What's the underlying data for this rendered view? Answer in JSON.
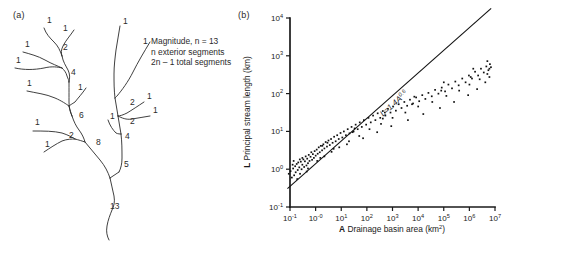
{
  "figure": {
    "panel_a": {
      "label": "(a)",
      "annotation_lines": [
        "Magnitude, n = 13",
        "n exterior segments",
        "2n – 1 total segments"
      ],
      "magnitude_labels": [
        {
          "text": "1",
          "x": 47,
          "y": 23
        },
        {
          "text": "1",
          "x": 63,
          "y": 31
        },
        {
          "text": "1",
          "x": 25,
          "y": 47
        },
        {
          "text": "1",
          "x": 16,
          "y": 63
        },
        {
          "text": "2",
          "x": 63,
          "y": 50
        },
        {
          "text": "1",
          "x": 27,
          "y": 86
        },
        {
          "text": "4",
          "x": 71,
          "y": 75
        },
        {
          "text": "1",
          "x": 78,
          "y": 90
        },
        {
          "text": "6",
          "x": 79,
          "y": 118
        },
        {
          "text": "1",
          "x": 35,
          "y": 125
        },
        {
          "text": "2",
          "x": 69,
          "y": 138
        },
        {
          "text": "1",
          "x": 45,
          "y": 147
        },
        {
          "text": "8",
          "x": 96,
          "y": 145
        },
        {
          "text": "13",
          "x": 110,
          "y": 209
        },
        {
          "text": "1",
          "x": 123,
          "y": 24
        },
        {
          "text": "1",
          "x": 143,
          "y": 44
        },
        {
          "text": "2",
          "x": 130,
          "y": 105
        },
        {
          "text": "1",
          "x": 147,
          "y": 99
        },
        {
          "text": "1",
          "x": 153,
          "y": 113
        },
        {
          "text": "1",
          "x": 110,
          "y": 119
        },
        {
          "text": "2",
          "x": 130,
          "y": 124
        },
        {
          "text": "4",
          "x": 125,
          "y": 139
        },
        {
          "text": "5",
          "x": 124,
          "y": 167
        }
      ]
    },
    "panel_b": {
      "label": "(b)",
      "equation": {
        "base": "L=1.4A",
        "exponent": "0.6"
      },
      "x_axis": {
        "title_symbol": "A",
        "title_text": "Drainage basin area (km",
        "title_sup": "2",
        "title_tail": ")",
        "ticks": [
          {
            "mantissa": "10",
            "exponent": "-1"
          },
          {
            "mantissa": "10",
            "exponent": "-0"
          },
          {
            "mantissa": "10",
            "exponent": "1"
          },
          {
            "mantissa": "10",
            "exponent": "2"
          },
          {
            "mantissa": "10",
            "exponent": "3"
          },
          {
            "mantissa": "10",
            "exponent": "4"
          },
          {
            "mantissa": "10",
            "exponent": "5"
          },
          {
            "mantissa": "10",
            "exponent": "6"
          },
          {
            "mantissa": "10",
            "exponent": "7"
          }
        ]
      },
      "y_axis": {
        "title_symbol": "L",
        "title_text": "Principal stream length (km)",
        "ticks": [
          {
            "mantissa": "10",
            "exponent": "4"
          },
          {
            "mantissa": "10",
            "exponent": "3"
          },
          {
            "mantissa": "10",
            "exponent": "2"
          },
          {
            "mantissa": "10",
            "exponent": "1"
          },
          {
            "mantissa": "10",
            "exponent": "0"
          },
          {
            "mantissa": "10",
            "exponent": "-1"
          }
        ]
      }
    }
  },
  "chart_data": {
    "type": "scatter",
    "title": "",
    "xlabel": "A Drainage basin area (km2)",
    "ylabel": "L Principal stream length (km)",
    "xscale": "log",
    "yscale": "log",
    "xlim": [
      -1,
      7
    ],
    "ylim": [
      -1,
      4
    ],
    "grid": false,
    "legend": null,
    "fit": {
      "label": "L=1.4A^0.6",
      "coefficient": 1.4,
      "exponent": 0.6,
      "x_range_log10": [
        -1.1,
        6.85
      ]
    },
    "points_log10": [
      [
        -1.05,
        -0.12
      ],
      [
        -0.98,
        -0.05
      ],
      [
        -0.93,
        -0.22
      ],
      [
        -0.88,
        0.02
      ],
      [
        -0.84,
        -0.16
      ],
      [
        -0.8,
        0.08
      ],
      [
        -0.78,
        -0.08
      ],
      [
        -0.74,
        0.14
      ],
      [
        -0.7,
        -0.02
      ],
      [
        -0.68,
        0.18
      ],
      [
        -0.64,
        0.05
      ],
      [
        -0.61,
        -0.12
      ],
      [
        -0.58,
        0.2
      ],
      [
        -0.55,
        0.0
      ],
      [
        -0.52,
        0.12
      ],
      [
        -0.48,
        0.26
      ],
      [
        -0.45,
        0.06
      ],
      [
        -0.42,
        0.21
      ],
      [
        -0.39,
        0.34
      ],
      [
        -0.36,
        0.1
      ],
      [
        -0.33,
        0.28
      ],
      [
        -0.3,
        0.16
      ],
      [
        -0.27,
        0.38
      ],
      [
        -0.24,
        0.22
      ],
      [
        -0.2,
        0.33
      ],
      [
        -0.17,
        0.45
      ],
      [
        -0.14,
        0.25
      ],
      [
        -0.11,
        0.4
      ],
      [
        -0.07,
        0.3
      ],
      [
        -0.04,
        0.48
      ],
      [
        0.0,
        0.36
      ],
      [
        0.04,
        0.52
      ],
      [
        0.08,
        0.41
      ],
      [
        0.12,
        0.58
      ],
      [
        0.16,
        0.45
      ],
      [
        0.2,
        0.62
      ],
      [
        0.25,
        0.5
      ],
      [
        0.3,
        0.66
      ],
      [
        0.34,
        0.55
      ],
      [
        0.39,
        0.72
      ],
      [
        0.44,
        0.6
      ],
      [
        0.5,
        0.76
      ],
      [
        0.55,
        0.64
      ],
      [
        0.6,
        0.8
      ],
      [
        0.66,
        0.7
      ],
      [
        0.72,
        0.86
      ],
      [
        0.78,
        0.74
      ],
      [
        0.84,
        0.9
      ],
      [
        0.9,
        0.8
      ],
      [
        0.97,
        0.96
      ],
      [
        1.04,
        0.84
      ],
      [
        1.1,
        1.0
      ],
      [
        1.18,
        0.9
      ],
      [
        1.25,
        1.06
      ],
      [
        1.32,
        0.95
      ],
      [
        1.4,
        1.12
      ],
      [
        1.48,
        1.0
      ],
      [
        1.56,
        1.18
      ],
      [
        1.64,
        1.06
      ],
      [
        1.72,
        1.24
      ],
      [
        1.8,
        1.12
      ],
      [
        1.88,
        1.3
      ],
      [
        1.97,
        1.18
      ],
      [
        2.06,
        1.36
      ],
      [
        2.15,
        1.24
      ],
      [
        2.24,
        1.42
      ],
      [
        2.33,
        1.3
      ],
      [
        2.42,
        1.48
      ],
      [
        2.52,
        1.36
      ],
      [
        2.62,
        1.54
      ],
      [
        2.72,
        1.42
      ],
      [
        2.82,
        1.6
      ],
      [
        2.92,
        1.5
      ],
      [
        3.02,
        1.66
      ],
      [
        3.13,
        1.55
      ],
      [
        3.24,
        1.72
      ],
      [
        3.35,
        1.62
      ],
      [
        3.46,
        1.78
      ],
      [
        3.57,
        1.68
      ],
      [
        3.68,
        1.84
      ],
      [
        3.8,
        1.74
      ],
      [
        3.92,
        1.9
      ],
      [
        4.04,
        1.8
      ],
      [
        4.16,
        1.96
      ],
      [
        4.28,
        1.86
      ],
      [
        4.4,
        2.02
      ],
      [
        4.53,
        1.93
      ],
      [
        4.66,
        2.1
      ],
      [
        4.79,
        2.0
      ],
      [
        4.92,
        2.16
      ],
      [
        5.05,
        2.06
      ],
      [
        5.18,
        2.24
      ],
      [
        5.32,
        2.14
      ],
      [
        5.45,
        2.32
      ],
      [
        5.58,
        2.22
      ],
      [
        5.72,
        2.4
      ],
      [
        5.85,
        2.3
      ],
      [
        5.98,
        2.48
      ],
      [
        6.1,
        2.4
      ],
      [
        6.22,
        2.58
      ],
      [
        6.34,
        2.48
      ],
      [
        6.45,
        2.66
      ],
      [
        6.56,
        2.56
      ],
      [
        6.66,
        2.72
      ],
      [
        6.74,
        2.62
      ],
      [
        6.8,
        2.78
      ],
      [
        6.84,
        2.7
      ],
      [
        -0.9,
        0.12
      ],
      [
        -0.62,
        0.26
      ],
      [
        -0.35,
        -0.06
      ],
      [
        0.06,
        0.22
      ],
      [
        0.34,
        0.34
      ],
      [
        0.62,
        0.46
      ],
      [
        0.92,
        0.58
      ],
      [
        1.3,
        0.74
      ],
      [
        1.7,
        0.88
      ],
      [
        2.1,
        1.06
      ],
      [
        2.55,
        1.2
      ],
      [
        3.0,
        1.36
      ],
      [
        3.5,
        1.5
      ],
      [
        4.0,
        1.66
      ],
      [
        4.55,
        1.78
      ],
      [
        5.1,
        1.94
      ],
      [
        5.6,
        2.08
      ],
      [
        6.0,
        2.24
      ],
      [
        6.4,
        2.38
      ],
      [
        6.7,
        2.52
      ],
      [
        -0.72,
        -0.26
      ],
      [
        -0.3,
        0.02
      ],
      [
        0.18,
        0.3
      ],
      [
        0.7,
        0.54
      ],
      [
        1.22,
        0.66
      ],
      [
        1.85,
        0.82
      ],
      [
        2.4,
        0.98
      ],
      [
        2.95,
        1.14
      ],
      [
        3.6,
        1.3
      ],
      [
        4.2,
        1.46
      ],
      [
        4.85,
        1.62
      ],
      [
        5.4,
        1.78
      ],
      [
        5.95,
        1.96
      ],
      [
        6.3,
        2.12
      ],
      [
        6.62,
        2.3
      ],
      [
        6.78,
        2.44
      ],
      [
        -0.52,
        0.3
      ],
      [
        0.46,
        0.7
      ],
      [
        1.52,
        1.08
      ],
      [
        2.7,
        1.5
      ],
      [
        3.85,
        1.92
      ],
      [
        5.0,
        2.3
      ],
      [
        6.15,
        2.66
      ],
      [
        6.7,
        2.86
      ],
      [
        -0.86,
        0.22
      ],
      [
        0.26,
        0.62
      ],
      [
        1.44,
        0.98
      ],
      [
        2.62,
        1.34
      ],
      [
        3.76,
        1.72
      ],
      [
        4.9,
        2.08
      ],
      [
        6.05,
        2.44
      ],
      [
        6.78,
        2.66
      ]
    ]
  }
}
